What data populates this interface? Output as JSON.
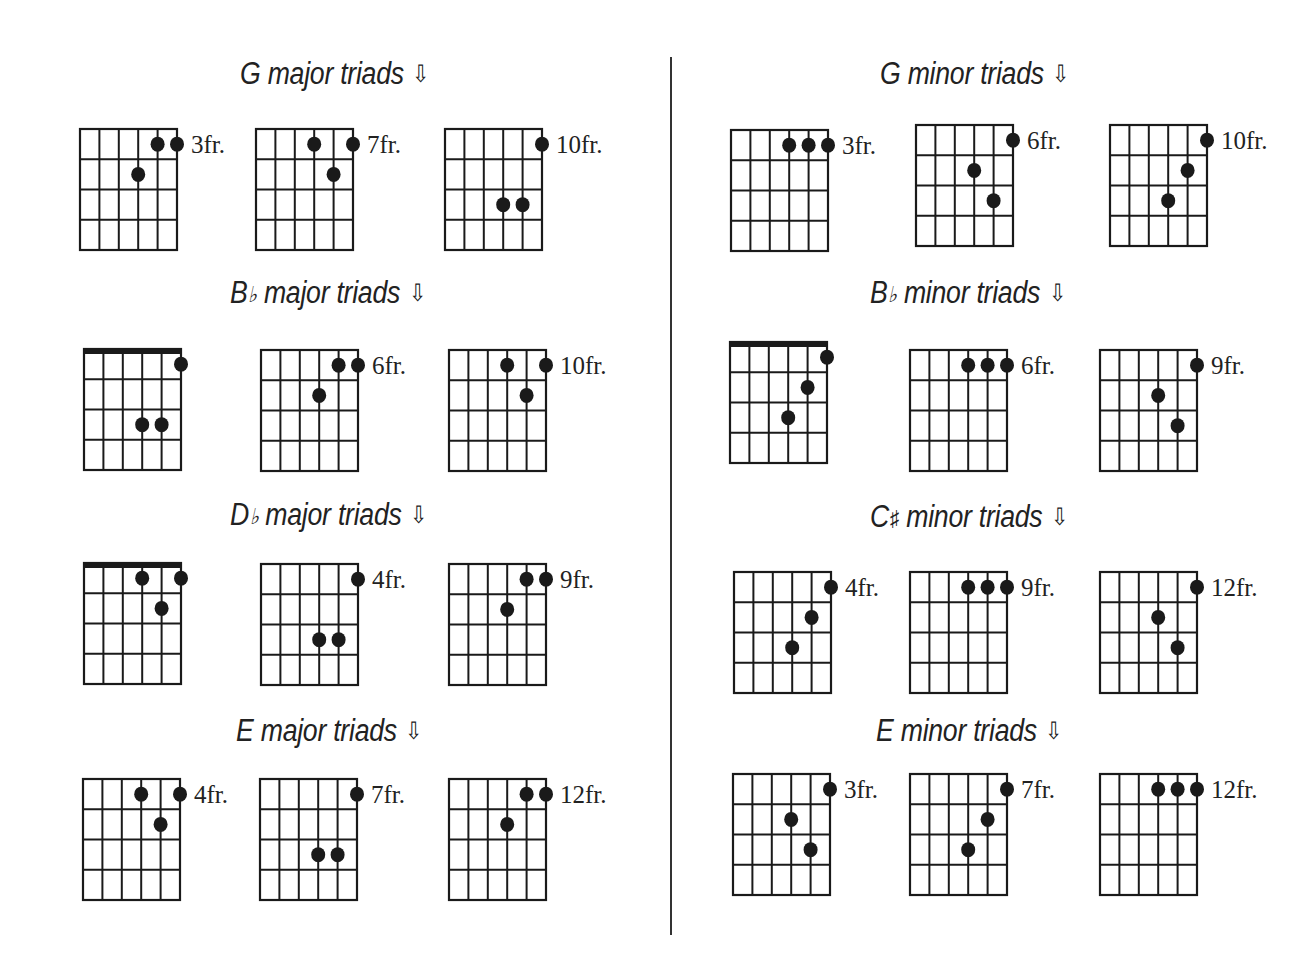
{
  "page": {
    "divider": true,
    "colors": {
      "ink": "#1a1a1a",
      "background": "#ffffff"
    },
    "arrow_icon": "⇩"
  },
  "sections": [
    {
      "id": "g-major",
      "root": "G",
      "accidental": "",
      "quality": "major triads",
      "title_x": 240,
      "title_y": 56,
      "diagrams": [
        {
          "x": 80,
          "y": 129,
          "nut": false,
          "fret_label": "3fr.",
          "dots": [
            [
              5,
              1
            ],
            [
              6,
              1
            ],
            [
              4,
              2
            ]
          ]
        },
        {
          "x": 256,
          "y": 129,
          "nut": false,
          "fret_label": "7fr.",
          "dots": [
            [
              4,
              1
            ],
            [
              6,
              1
            ],
            [
              5,
              2
            ]
          ]
        },
        {
          "x": 445,
          "y": 129,
          "nut": false,
          "fret_label": "10fr.",
          "dots": [
            [
              6,
              1
            ],
            [
              4,
              3
            ],
            [
              5,
              3
            ]
          ]
        }
      ]
    },
    {
      "id": "bb-major",
      "root": "B",
      "accidental": "♭",
      "quality": "major triads",
      "title_x": 230,
      "title_y": 275,
      "diagrams": [
        {
          "x": 84,
          "y": 349,
          "nut": true,
          "fret_label": "",
          "dots": [
            [
              6,
              1
            ],
            [
              4,
              3
            ],
            [
              5,
              3
            ]
          ]
        },
        {
          "x": 261,
          "y": 350,
          "nut": false,
          "fret_label": "6fr.",
          "dots": [
            [
              5,
              1
            ],
            [
              6,
              1
            ],
            [
              4,
              2
            ]
          ]
        },
        {
          "x": 449,
          "y": 350,
          "nut": false,
          "fret_label": "10fr.",
          "dots": [
            [
              4,
              1
            ],
            [
              6,
              1
            ],
            [
              5,
              2
            ]
          ]
        }
      ]
    },
    {
      "id": "db-major",
      "root": "D",
      "accidental": "♭",
      "quality": "major triads",
      "title_x": 230,
      "title_y": 497,
      "diagrams": [
        {
          "x": 84,
          "y": 563,
          "nut": true,
          "fret_label": "",
          "dots": [
            [
              4,
              1
            ],
            [
              6,
              1
            ],
            [
              5,
              2
            ]
          ]
        },
        {
          "x": 261,
          "y": 564,
          "nut": false,
          "fret_label": "4fr.",
          "dots": [
            [
              6,
              1
            ],
            [
              4,
              3
            ],
            [
              5,
              3
            ]
          ]
        },
        {
          "x": 449,
          "y": 564,
          "nut": false,
          "fret_label": "9fr.",
          "dots": [
            [
              5,
              1
            ],
            [
              6,
              1
            ],
            [
              4,
              2
            ]
          ]
        }
      ]
    },
    {
      "id": "e-major",
      "root": "E",
      "accidental": "",
      "quality": "major triads",
      "title_x": 236,
      "title_y": 713,
      "diagrams": [
        {
          "x": 83,
          "y": 779,
          "nut": false,
          "fret_label": "4fr.",
          "dots": [
            [
              4,
              1
            ],
            [
              6,
              1
            ],
            [
              5,
              2
            ]
          ]
        },
        {
          "x": 260,
          "y": 779,
          "nut": false,
          "fret_label": "7fr.",
          "dots": [
            [
              6,
              1
            ],
            [
              4,
              3
            ],
            [
              5,
              3
            ]
          ]
        },
        {
          "x": 449,
          "y": 779,
          "nut": false,
          "fret_label": "12fr.",
          "dots": [
            [
              5,
              1
            ],
            [
              6,
              1
            ],
            [
              4,
              2
            ]
          ]
        }
      ]
    },
    {
      "id": "g-minor",
      "root": "G",
      "accidental": "",
      "quality": "minor triads",
      "title_x": 880,
      "title_y": 56,
      "diagrams": [
        {
          "x": 731,
          "y": 130,
          "nut": false,
          "fret_label": "3fr.",
          "dots": [
            [
              4,
              1
            ],
            [
              5,
              1
            ],
            [
              6,
              1
            ]
          ]
        },
        {
          "x": 916,
          "y": 125,
          "nut": false,
          "fret_label": "6fr.",
          "dots": [
            [
              6,
              1
            ],
            [
              4,
              2
            ],
            [
              5,
              3
            ]
          ]
        },
        {
          "x": 1110,
          "y": 125,
          "nut": false,
          "fret_label": "10fr.",
          "dots": [
            [
              6,
              1
            ],
            [
              5,
              2
            ],
            [
              4,
              3
            ]
          ]
        }
      ]
    },
    {
      "id": "bb-minor",
      "root": "B",
      "accidental": "♭",
      "quality": "minor triads",
      "title_x": 870,
      "title_y": 275,
      "diagrams": [
        {
          "x": 730,
          "y": 342,
          "nut": true,
          "fret_label": "",
          "dots": [
            [
              6,
              1
            ],
            [
              5,
              2
            ],
            [
              4,
              3
            ]
          ]
        },
        {
          "x": 910,
          "y": 350,
          "nut": false,
          "fret_label": "6fr.",
          "dots": [
            [
              4,
              1
            ],
            [
              5,
              1
            ],
            [
              6,
              1
            ]
          ]
        },
        {
          "x": 1100,
          "y": 350,
          "nut": false,
          "fret_label": "9fr.",
          "dots": [
            [
              6,
              1
            ],
            [
              4,
              2
            ],
            [
              5,
              3
            ]
          ]
        }
      ]
    },
    {
      "id": "csharp-minor",
      "root": "C",
      "accidental": "♯",
      "quality": "minor triads",
      "title_x": 870,
      "title_y": 499,
      "diagrams": [
        {
          "x": 734,
          "y": 572,
          "nut": false,
          "fret_label": "4fr.",
          "dots": [
            [
              6,
              1
            ],
            [
              5,
              2
            ],
            [
              4,
              3
            ]
          ]
        },
        {
          "x": 910,
          "y": 572,
          "nut": false,
          "fret_label": "9fr.",
          "dots": [
            [
              4,
              1
            ],
            [
              5,
              1
            ],
            [
              6,
              1
            ]
          ]
        },
        {
          "x": 1100,
          "y": 572,
          "nut": false,
          "fret_label": "12fr.",
          "dots": [
            [
              6,
              1
            ],
            [
              4,
              2
            ],
            [
              5,
              3
            ]
          ]
        }
      ]
    },
    {
      "id": "e-minor",
      "root": "E",
      "accidental": "",
      "quality": "minor triads",
      "title_x": 876,
      "title_y": 713,
      "diagrams": [
        {
          "x": 733,
          "y": 774,
          "nut": false,
          "fret_label": "3fr.",
          "dots": [
            [
              6,
              1
            ],
            [
              4,
              2
            ],
            [
              5,
              3
            ]
          ]
        },
        {
          "x": 910,
          "y": 774,
          "nut": false,
          "fret_label": "7fr.",
          "dots": [
            [
              6,
              1
            ],
            [
              5,
              2
            ],
            [
              4,
              3
            ]
          ]
        },
        {
          "x": 1100,
          "y": 774,
          "nut": false,
          "fret_label": "12fr.",
          "dots": [
            [
              4,
              1
            ],
            [
              5,
              1
            ],
            [
              6,
              1
            ]
          ]
        }
      ]
    }
  ]
}
